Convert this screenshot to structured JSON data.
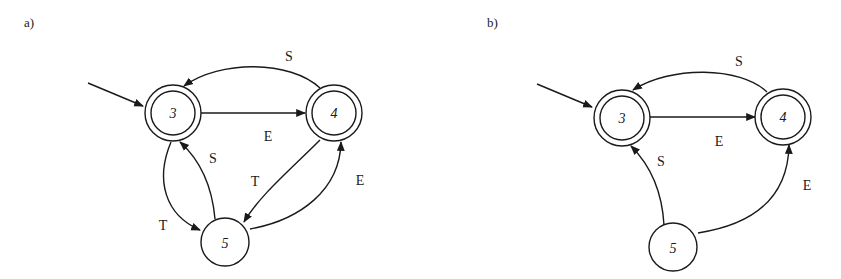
{
  "panels": [
    {
      "label": "a)",
      "states": [
        {
          "id": "3",
          "label": "3",
          "accepting": true,
          "initial": true
        },
        {
          "id": "4",
          "label": "4",
          "accepting": true,
          "initial": false
        },
        {
          "id": "5",
          "label": "5",
          "accepting": false,
          "initial": false
        }
      ],
      "transitions": [
        {
          "from": "3",
          "to": "4",
          "label": "E"
        },
        {
          "from": "4",
          "to": "3",
          "label": "S"
        },
        {
          "from": "3",
          "to": "5",
          "label": "T"
        },
        {
          "from": "5",
          "to": "3",
          "label": "S"
        },
        {
          "from": "4",
          "to": "5",
          "label": "T"
        },
        {
          "from": "5",
          "to": "4",
          "label": "E"
        }
      ]
    },
    {
      "label": "b)",
      "states": [
        {
          "id": "3",
          "label": "3",
          "accepting": true,
          "initial": true
        },
        {
          "id": "4",
          "label": "4",
          "accepting": true,
          "initial": false
        },
        {
          "id": "5",
          "label": "5",
          "accepting": false,
          "initial": false
        }
      ],
      "transitions": [
        {
          "from": "3",
          "to": "4",
          "label": "E"
        },
        {
          "from": "4",
          "to": "3",
          "label": "S"
        },
        {
          "from": "5",
          "to": "3",
          "label": "S"
        },
        {
          "from": "5",
          "to": "4",
          "label": "E"
        }
      ]
    }
  ]
}
